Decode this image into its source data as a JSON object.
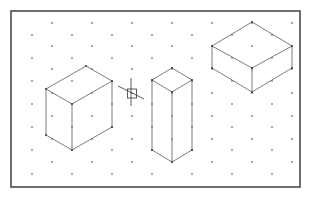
{
  "canvas": {
    "width": 313,
    "height": 197,
    "background": "#ffffff"
  },
  "frame": {
    "x": 11,
    "y": 11,
    "width": 289,
    "height": 176,
    "stroke": "#4a4a4a"
  },
  "isometric_grid": {
    "dot_color": "#3a3a3a",
    "column_x_start": 32,
    "column_spacing": 20,
    "column_count": 14,
    "even_column_rows_y": [
      35,
      58,
      81,
      104,
      127,
      150,
      174
    ],
    "odd_column_rows_y": [
      23,
      46,
      69,
      93,
      116,
      139,
      162
    ]
  },
  "shapes": [
    {
      "name": "left-box",
      "edge_color": "#6e6e6e",
      "vertices": {
        "top_back": [
          86,
          66
        ],
        "top_left": [
          46,
          89
        ],
        "top_front": [
          72,
          104
        ],
        "top_right": [
          112,
          81
        ],
        "bottom_left": [
          46,
          135
        ],
        "bottom_front": [
          72,
          150
        ],
        "bottom_right": [
          112,
          127
        ]
      }
    },
    {
      "name": "tall-prism",
      "edge_color": "#6e6e6e",
      "vertices": {
        "top_back": [
          172,
          68
        ],
        "top_left": [
          152,
          80
        ],
        "top_front": [
          172,
          92
        ],
        "top_right": [
          192,
          80
        ],
        "bottom_left": [
          152,
          150
        ],
        "bottom_front": [
          172,
          162
        ],
        "bottom_right": [
          192,
          150
        ]
      }
    },
    {
      "name": "flat-box",
      "edge_color": "#6e6e6e",
      "vertices": {
        "top_back": [
          252,
          22
        ],
        "top_left": [
          212,
          46
        ],
        "top_front": [
          252,
          68
        ],
        "top_right": [
          292,
          46
        ],
        "bottom_left": [
          212,
          68
        ],
        "bottom_front": [
          252,
          92
        ],
        "bottom_right": [
          292,
          68
        ]
      }
    }
  ],
  "cursor": {
    "type": "crosshair-pickbox",
    "center": [
      131,
      93
    ],
    "vertical_line": [
      [
        131,
        78
      ],
      [
        131,
        106
      ]
    ],
    "diagonal_line": [
      [
        118,
        86
      ],
      [
        144,
        99
      ]
    ],
    "pickbox": {
      "x": 127.5,
      "y": 89,
      "size": 9
    }
  }
}
